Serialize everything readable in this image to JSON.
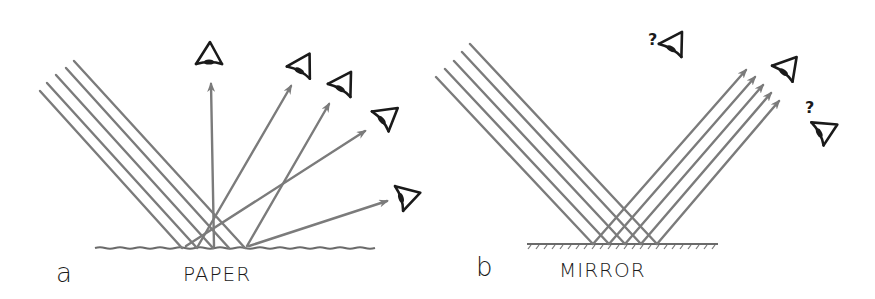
{
  "panels": [
    {
      "id": "a",
      "letter": "a",
      "surface_label": "PAPER",
      "reflection": "diffuse",
      "incident_rays": 5,
      "reflected_rays": 5,
      "observers": 5
    },
    {
      "id": "b",
      "letter": "b",
      "surface_label": "MIRROR",
      "reflection": "specular",
      "incident_rays": 5,
      "reflected_rays": 5,
      "observers": 3,
      "uncertain_observer_marks": [
        "?",
        "?"
      ]
    }
  ],
  "colors": {
    "ray": "#7b7b7b",
    "eye": "#1a1a1a",
    "background": "#ffffff"
  }
}
